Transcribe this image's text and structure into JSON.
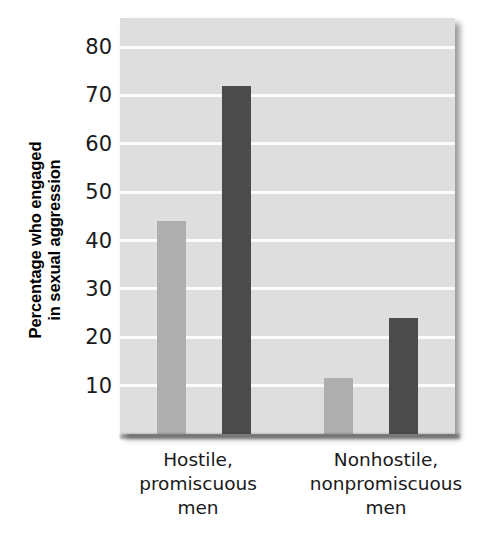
{
  "chart_data": {
    "type": "bar",
    "title": "",
    "xlabel": "",
    "ylabel_line1": "Percentage who engaged",
    "ylabel_line2": "in sexual aggression",
    "ylabel": "Percentage who engaged in sexual aggression",
    "categories": [
      {
        "line1": "Hostile,",
        "line2": "promiscuous",
        "line3": "men"
      },
      {
        "line1": "Nonhostile,",
        "line2": "nonpromiscuous",
        "line3": "men"
      }
    ],
    "series": [
      {
        "name": "light-series",
        "color": "#aeaeae",
        "values": [
          44,
          11.5
        ]
      },
      {
        "name": "dark-series",
        "color": "#4b4b4b",
        "values": [
          72,
          24
        ]
      }
    ],
    "ylim": [
      0,
      86
    ],
    "yticks": [
      10,
      20,
      30,
      40,
      50,
      60,
      70,
      80
    ],
    "ytick_labels": [
      "10",
      "20",
      "30",
      "40",
      "50",
      "60",
      "70",
      "80"
    ],
    "grid": true,
    "grid_color": "#fbfbfb",
    "plot_background": "#dedede",
    "legend": "none"
  }
}
